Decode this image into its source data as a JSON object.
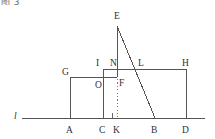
{
  "figure": {
    "caption": "图 3",
    "line_label": "l",
    "stroke_color": "#555555",
    "dotted_color": "#777777",
    "background": "#ffffff",
    "points": [
      {
        "name": "E",
        "label": "E",
        "x": 117,
        "y": 22,
        "lx": 114,
        "ly": 12
      },
      {
        "name": "G",
        "label": "G",
        "x": 70,
        "y": 77,
        "lx": 62,
        "ly": 68
      },
      {
        "name": "I",
        "label": "I",
        "x": 103,
        "y": 69,
        "lx": 96,
        "ly": 59
      },
      {
        "name": "N",
        "label": "N",
        "x": 117,
        "y": 69,
        "lx": 110,
        "ly": 59
      },
      {
        "name": "L",
        "label": "L",
        "x": 140,
        "y": 69,
        "lx": 138,
        "ly": 59
      },
      {
        "name": "H",
        "label": "H",
        "x": 186,
        "y": 69,
        "lx": 182,
        "ly": 59
      },
      {
        "name": "O",
        "label": "O",
        "x": 103,
        "y": 77,
        "lx": 95,
        "ly": 81
      },
      {
        "name": "F",
        "label": "F",
        "x": 117,
        "y": 77,
        "lx": 119,
        "ly": 79
      },
      {
        "name": "A",
        "label": "A",
        "x": 70,
        "y": 118,
        "lx": 66,
        "ly": 126
      },
      {
        "name": "C",
        "label": "C",
        "x": 103,
        "y": 118,
        "lx": 99,
        "ly": 126
      },
      {
        "name": "K",
        "label": "K",
        "x": 117,
        "y": 118,
        "lx": 113,
        "ly": 126
      },
      {
        "name": "B",
        "label": "B",
        "x": 155,
        "y": 118,
        "lx": 151,
        "ly": 126
      },
      {
        "name": "D",
        "label": "D",
        "x": 186,
        "y": 118,
        "lx": 182,
        "ly": 126
      }
    ],
    "segments": [
      {
        "name": "line-l",
        "x1": 22,
        "y1": 118,
        "x2": 205,
        "y2": 118,
        "style": "solid"
      },
      {
        "name": "segment-A-G",
        "x1": 70,
        "y1": 118,
        "x2": 70,
        "y2": 77,
        "style": "solid"
      },
      {
        "name": "segment-G-O",
        "x1": 70,
        "y1": 77,
        "x2": 117,
        "y2": 77,
        "style": "solid"
      },
      {
        "name": "segment-C-I",
        "x1": 103,
        "y1": 118,
        "x2": 103,
        "y2": 69,
        "style": "solid"
      },
      {
        "name": "segment-I-H",
        "x1": 103,
        "y1": 69,
        "x2": 186,
        "y2": 69,
        "style": "solid"
      },
      {
        "name": "segment-H-D",
        "x1": 186,
        "y1": 69,
        "x2": 186,
        "y2": 118,
        "style": "solid"
      },
      {
        "name": "segment-E-N-F",
        "x1": 117,
        "y1": 26,
        "x2": 117,
        "y2": 77,
        "style": "solid"
      },
      {
        "name": "segment-E-L-B",
        "x1": 117,
        "y1": 26,
        "x2": 155,
        "y2": 118,
        "style": "solid"
      },
      {
        "name": "segment-F-K-dotted",
        "x1": 117,
        "y1": 79,
        "x2": 117,
        "y2": 117,
        "style": "dotted"
      }
    ],
    "right_angle_marker": {
      "name": "right-angle-at-K",
      "x": 112,
      "y": 113,
      "size": 5
    }
  }
}
